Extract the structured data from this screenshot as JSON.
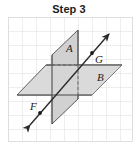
{
  "title": "Step 3",
  "figure": {
    "name": "two-intersecting-planes-with-line",
    "background_color": "#ffffff",
    "grid": {
      "visible": true,
      "color": "#dcdcdc",
      "cell_size": 14,
      "columns": 9,
      "rows": 9,
      "area": {
        "x": 8,
        "y": 17,
        "width": 125,
        "height": 125
      }
    },
    "planes": [
      {
        "label": "A",
        "orientation": "vertical",
        "fill_color": "#d2d2d2",
        "stroke_color": "#4a4a4a",
        "points": "78,30 78,99 52,124 52,55",
        "label_pos": {
          "x": 66,
          "y": 48
        }
      },
      {
        "label": "B",
        "orientation": "horizontal",
        "fill_color": "#d8d8d8",
        "stroke_color": "#4a4a4a",
        "points": "46,65 122,65 92,95 17,95",
        "label_pos": {
          "x": 97,
          "y": 77
        }
      }
    ],
    "line": {
      "name": "line-FG",
      "stroke_color": "#2b2b2b",
      "start": {
        "x": 28,
        "y": 126
      },
      "end": {
        "x": 110,
        "y": 33
      },
      "arrow_both_ends": true
    },
    "points": [
      {
        "label": "F",
        "dot": {
          "x": 40,
          "y": 113
        },
        "label_pos": {
          "x": 31,
          "y": 108
        }
      },
      {
        "label": "G",
        "dot": {
          "x": 92,
          "y": 53
        },
        "label_pos": {
          "x": 96,
          "y": 61
        }
      }
    ],
    "hidden_edges": {
      "style": "dashed",
      "color": "#6e6e6e",
      "segments": [
        {
          "name": "hidden-horizontal",
          "x1": 52,
          "y1": 65,
          "x2": 78,
          "y2": 65
        },
        {
          "name": "hidden-vertical",
          "x1": 78,
          "y1": 65,
          "x2": 78,
          "y2": 95
        }
      ]
    },
    "intersection_lines": [
      {
        "name": "plane-intersection-front",
        "x1": 17,
        "y1": 95,
        "x2": 92,
        "y2": 95
      },
      {
        "name": "plane-intersection-back",
        "x1": 46,
        "y1": 65,
        "x2": 122,
        "y2": 65
      }
    ]
  }
}
